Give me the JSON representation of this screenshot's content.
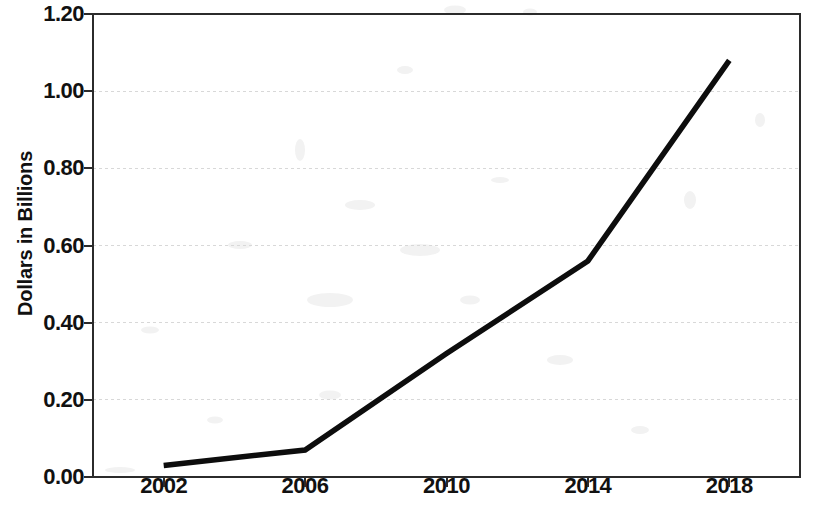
{
  "chart_data": {
    "type": "line",
    "title": "",
    "xlabel": "",
    "ylabel": "Dollars in Billions",
    "x": [
      2002,
      2006,
      2010,
      2014,
      2018
    ],
    "values": [
      0.03,
      0.07,
      0.32,
      0.56,
      1.08
    ],
    "series": [
      {
        "name": "Dollars in Billions",
        "values": [
          0.03,
          0.07,
          0.32,
          0.56,
          1.08
        ]
      }
    ],
    "xlim": [
      2000,
      2020
    ],
    "ylim": [
      0.0,
      1.2
    ],
    "x_tick_labels": [
      "2002",
      "2006",
      "2010",
      "2014",
      "2018"
    ],
    "y_tick_labels": [
      "0.00",
      "0.20",
      "0.40",
      "0.60",
      "0.80",
      "1.00",
      "1.20"
    ],
    "y_ticks": [
      0.0,
      0.2,
      0.4,
      0.6,
      0.8,
      1.0,
      1.2
    ],
    "grid": true,
    "grid_axis": "y",
    "legend": false,
    "legend_position": "none",
    "line_color": "#0d0d0d",
    "grid_color": "#d8d8d8",
    "frame_color": "#2b2b2b"
  },
  "axes": {
    "y_title": "Dollars in Billions"
  }
}
